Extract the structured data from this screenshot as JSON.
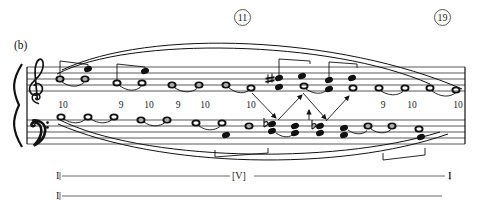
{
  "figure": {
    "panel_label": "(b)",
    "measure_numbers": [
      {
        "value": "11",
        "x": 234,
        "y": 9
      },
      {
        "value": "19",
        "x": 434,
        "y": 9
      }
    ]
  },
  "intervals": {
    "label_row_y": 104,
    "items": [
      {
        "value": "10",
        "x": 55
      },
      {
        "value": "9",
        "x": 113
      },
      {
        "value": "10",
        "x": 141
      },
      {
        "value": "9",
        "x": 170
      },
      {
        "value": "10",
        "x": 197
      },
      {
        "value": "10",
        "x": 243
      },
      {
        "value": "9",
        "x": 375
      },
      {
        "value": "10",
        "x": 404
      },
      {
        "value": "10",
        "x": 450
      }
    ]
  },
  "analysis": {
    "line1": {
      "start_label": "I",
      "middle_label": "[V]",
      "end_label": "I"
    },
    "line2": {
      "start_label": "I"
    }
  },
  "staff": {
    "clefs": {
      "treble": "treble-clef",
      "bass": "bass-clef"
    },
    "treble_notes": [
      {
        "x": 60,
        "y": 79,
        "head": "hollow",
        "stem": false
      },
      {
        "x": 85,
        "y": 79,
        "head": "hollow",
        "stem": false
      },
      {
        "x": 87,
        "y": 69,
        "head": "filled",
        "stem": false
      },
      {
        "x": 117,
        "y": 83,
        "head": "hollow",
        "stem": false
      },
      {
        "x": 142,
        "y": 83,
        "head": "hollow",
        "stem": false
      },
      {
        "x": 144,
        "y": 71,
        "head": "filled",
        "stem": false
      },
      {
        "x": 172,
        "y": 85,
        "head": "hollow",
        "stem": false
      },
      {
        "x": 199,
        "y": 85,
        "head": "hollow",
        "stem": false
      },
      {
        "x": 226,
        "y": 85,
        "head": "hollow",
        "stem": false
      },
      {
        "x": 251,
        "y": 87,
        "head": "hollow",
        "stem": false
      },
      {
        "x": 277,
        "y": 78,
        "head": "filled",
        "accidental": "sharp"
      },
      {
        "x": 277,
        "y": 86,
        "head": "filled"
      },
      {
        "x": 300,
        "y": 76,
        "head": "filled"
      },
      {
        "x": 303,
        "y": 86,
        "head": "hollow"
      },
      {
        "x": 328,
        "y": 80,
        "head": "filled"
      },
      {
        "x": 328,
        "y": 89,
        "head": "filled"
      },
      {
        "x": 352,
        "y": 78,
        "head": "filled"
      },
      {
        "x": 352,
        "y": 88,
        "head": "hollow"
      },
      {
        "x": 378,
        "y": 88,
        "head": "hollow"
      },
      {
        "x": 404,
        "y": 88,
        "head": "hollow"
      },
      {
        "x": 428,
        "y": 88,
        "head": "hollow"
      },
      {
        "x": 455,
        "y": 89,
        "head": "hollow"
      }
    ],
    "bass_notes": [
      {
        "x": 61,
        "y": 120,
        "head": "hollow"
      },
      {
        "x": 88,
        "y": 120,
        "head": "hollow"
      },
      {
        "x": 114,
        "y": 120,
        "head": "hollow"
      },
      {
        "x": 141,
        "y": 122,
        "head": "hollow"
      },
      {
        "x": 167,
        "y": 122,
        "head": "hollow"
      },
      {
        "x": 196,
        "y": 124,
        "head": "hollow"
      },
      {
        "x": 222,
        "y": 124,
        "head": "hollow"
      },
      {
        "x": 222,
        "y": 131,
        "head": "filled"
      },
      {
        "x": 249,
        "y": 126,
        "head": "hollow"
      },
      {
        "x": 266,
        "y": 124,
        "head": "filled",
        "accidental": "flat"
      },
      {
        "x": 291,
        "y": 126,
        "head": "filled"
      },
      {
        "x": 317,
        "y": 126,
        "head": "filled",
        "accidental": "flat"
      },
      {
        "x": 340,
        "y": 128,
        "head": "filled"
      },
      {
        "x": 362,
        "y": 128,
        "head": "hollow"
      },
      {
        "x": 391,
        "y": 128,
        "head": "hollow"
      },
      {
        "x": 417,
        "y": 128,
        "head": "hollow"
      },
      {
        "x": 417,
        "y": 136,
        "head": "filled"
      },
      {
        "x": 445,
        "y": 130,
        "head": "hollow"
      }
    ]
  }
}
